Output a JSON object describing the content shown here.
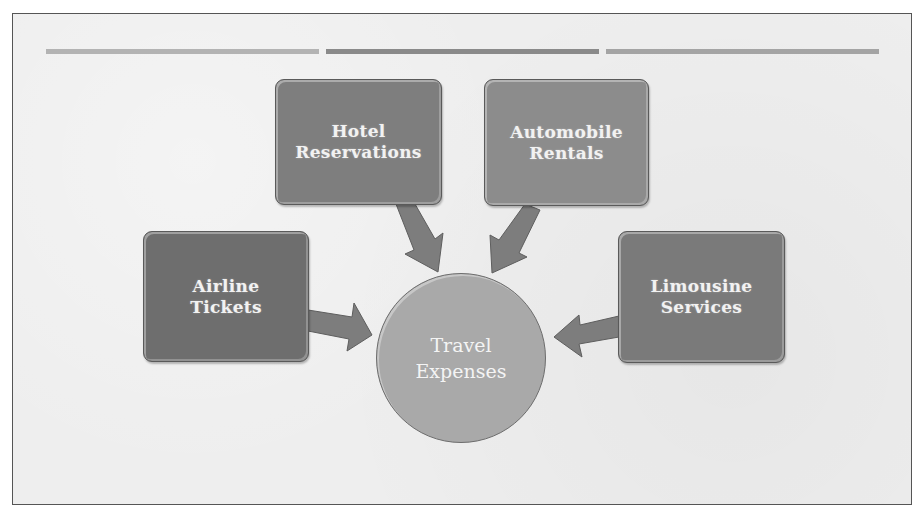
{
  "diagram": {
    "title": "Travel Expenses",
    "hub": {
      "label": "Travel\nExpenses",
      "color": "#a9a9a9"
    },
    "nodes": [
      {
        "id": "hotel",
        "label": "Hotel\nReservations",
        "color": "#7e7e7e"
      },
      {
        "id": "automobile",
        "label": "Automobile\nRentals",
        "color": "#8c8c8c"
      },
      {
        "id": "airline",
        "label": "Airline\nTickets",
        "color": "#6e6e6e"
      },
      {
        "id": "limousine",
        "label": "Limousine\nServices",
        "color": "#7a7a7a"
      }
    ],
    "edges": [
      {
        "from": "hotel",
        "to": "hub"
      },
      {
        "from": "automobile",
        "to": "hub"
      },
      {
        "from": "airline",
        "to": "hub"
      },
      {
        "from": "limousine",
        "to": "hub"
      }
    ],
    "arrow_color": "#7d7d7d",
    "header_bars": [
      {
        "color": "#b3b3b3"
      },
      {
        "color": "#8a8a8a"
      },
      {
        "color": "#a4a4a4"
      }
    ]
  }
}
